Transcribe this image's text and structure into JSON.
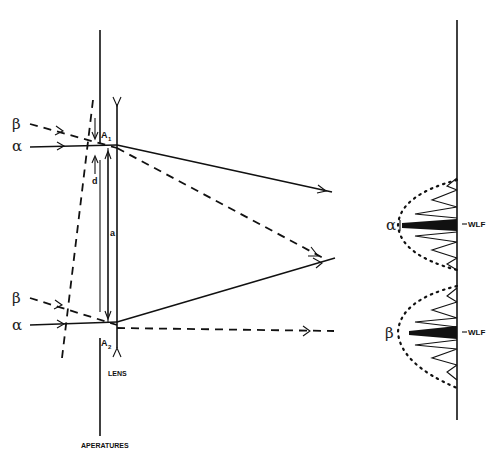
{
  "figure": {
    "type": "optical ray diagram with fringe intensity profile",
    "colors": {
      "ink": "#111111",
      "background": "#ffffff"
    }
  },
  "left_panel": {
    "rays": [
      {
        "label": "β",
        "style": "dashed",
        "role": "incoming oblique beam (upper)"
      },
      {
        "label": "α",
        "style": "solid",
        "role": "incoming axial beam (upper)"
      },
      {
        "label": "β",
        "style": "dashed",
        "role": "incoming oblique beam (lower)"
      },
      {
        "label": "α",
        "style": "solid",
        "role": "incoming axial beam (lower)"
      }
    ],
    "aperture_labels": {
      "upper": "A",
      "upper_sub": "1",
      "lower": "A",
      "lower_sub": "2"
    },
    "dimension_labels": {
      "d": "d",
      "a": "a"
    },
    "element_labels": {
      "lens": "LENS",
      "apertures": "APERATURES"
    }
  },
  "right_panel": {
    "peaks": [
      {
        "label": "α",
        "marker": "WLF"
      },
      {
        "label": "β",
        "marker": "WLF"
      }
    ],
    "marker_prefix": "–"
  }
}
